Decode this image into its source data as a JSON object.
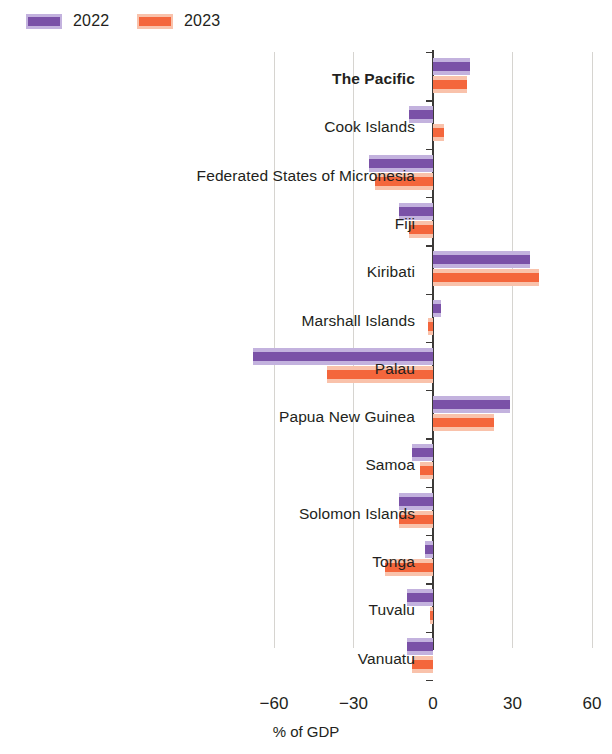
{
  "legend": {
    "items": [
      {
        "label": "2022",
        "color": "#7a51a7",
        "halo": "#c3b2de",
        "name": "legend-2022"
      },
      {
        "label": "2023",
        "color": "#f4663c",
        "halo": "#f9c2ab",
        "name": "legend-2023"
      }
    ]
  },
  "axis": {
    "title": "% of GDP",
    "ticks": [
      "−60",
      "−30",
      "0",
      "30",
      "60"
    ]
  },
  "chart_data": {
    "type": "bar",
    "orientation": "horizontal",
    "title": "",
    "subtitle": "",
    "xlabel": "% of GDP",
    "ylabel": "",
    "xlim": [
      -60,
      60
    ],
    "xticks": [
      -60,
      -30,
      0,
      30,
      60
    ],
    "grid": true,
    "legend_position": "top-left",
    "categories": [
      "The Pacific",
      "Cook Islands",
      "Federated States of Micronesia",
      "Fiji",
      "Kiribati",
      "Marshall Islands",
      "Palau",
      "Papua New Guinea",
      "Samoa",
      "Solomon Islands",
      "Tonga",
      "Tuvalu",
      "Vanuatu"
    ],
    "highlight_category": "The Pacific",
    "series": [
      {
        "name": "2022",
        "color": "#7a51a7",
        "values": [
          14,
          -9,
          -24,
          -13,
          36.5,
          3,
          -68,
          29,
          -8,
          -13,
          -3,
          -10,
          -10
        ]
      },
      {
        "name": "2023",
        "color": "#f4663c",
        "values": [
          13,
          4,
          -22,
          -9,
          40,
          -2,
          -40,
          23,
          -5,
          -13,
          -18,
          -1,
          -8
        ]
      }
    ]
  }
}
